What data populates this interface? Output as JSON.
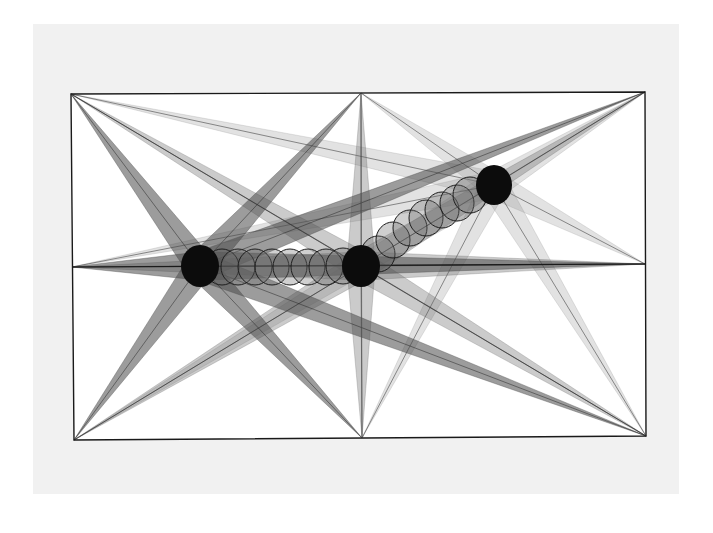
{
  "artwork": {
    "type": "geometric-abstract-drawing",
    "canvas": {
      "width": 713,
      "height": 533,
      "background": "#ffffff"
    },
    "paper": {
      "x": 33,
      "y": 24,
      "width": 646,
      "height": 470,
      "color": "#f1f1f1"
    },
    "frame": {
      "outer": {
        "tl": [
          71,
          94
        ],
        "tr": [
          645,
          92
        ],
        "br": [
          646,
          436
        ],
        "bl": [
          74,
          440
        ]
      },
      "midpoints": {
        "top": [
          361,
          93
        ],
        "bottom": [
          362,
          438
        ],
        "left": [
          72,
          267
        ],
        "right": [
          645,
          264
        ]
      },
      "stroke": "#1a1a1a"
    },
    "anchors": [
      {
        "name": "top-left",
        "pt": [
          71,
          94
        ]
      },
      {
        "name": "top-mid",
        "pt": [
          361,
          93
        ]
      },
      {
        "name": "top-right",
        "pt": [
          645,
          92
        ]
      },
      {
        "name": "right-mid",
        "pt": [
          645,
          264
        ]
      },
      {
        "name": "bottom-right",
        "pt": [
          646,
          436
        ]
      },
      {
        "name": "bottom-mid",
        "pt": [
          362,
          438
        ]
      },
      {
        "name": "bottom-left",
        "pt": [
          74,
          440
        ]
      },
      {
        "name": "left-mid",
        "pt": [
          72,
          267
        ]
      }
    ],
    "discs": [
      {
        "name": "left-disc",
        "cx": 200,
        "cy": 266,
        "rx": 19,
        "ry": 21,
        "wedge_color": "#4a4a4a",
        "wedge_opacity": 0.55
      },
      {
        "name": "middle-disc",
        "cx": 361,
        "cy": 266,
        "rx": 19,
        "ry": 21,
        "wedge_color": "#6a6a6a",
        "wedge_opacity": 0.35
      },
      {
        "name": "right-disc",
        "cx": 494,
        "cy": 185,
        "rx": 18,
        "ry": 20,
        "wedge_color": "#8a8a8a",
        "wedge_opacity": 0.25
      }
    ],
    "chain_circles": [
      [
        222,
        267
      ],
      [
        238,
        267
      ],
      [
        255,
        267
      ],
      [
        272,
        267
      ],
      [
        290,
        267
      ],
      [
        308,
        267
      ],
      [
        326,
        267
      ],
      [
        343,
        266
      ],
      [
        378,
        254
      ],
      [
        393,
        240
      ],
      [
        410,
        228
      ],
      [
        426,
        218
      ],
      [
        442,
        210
      ],
      [
        457,
        203
      ],
      [
        470,
        195
      ]
    ],
    "chain_radius": 18,
    "diagonal_line": {
      "from": [
        71,
        94
      ],
      "to": [
        646,
        436
      ]
    },
    "center_vertical_line": {
      "from": [
        361,
        93
      ],
      "to": [
        362,
        438
      ]
    },
    "disc_color": "#0c0c0c"
  }
}
